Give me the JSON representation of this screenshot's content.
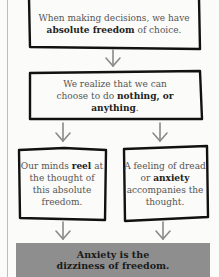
{
  "diagram": {
    "type": "flowchart",
    "colors": {
      "background": "#fbfbf9",
      "box_border": "#111111",
      "arrow": "#8a8a8a",
      "banner_fill": "#8e8e8e",
      "text": "#555555",
      "emphasis": "#222222"
    },
    "nodes": [
      {
        "id": "absolute-freedom",
        "parts": [
          {
            "text": "When making decisions, we have ",
            "bold": false
          },
          {
            "text": "absolute freedom",
            "bold": true
          },
          {
            "text": " of choice.",
            "bold": false
          }
        ]
      },
      {
        "id": "nothing-or-anything",
        "parts": [
          {
            "text": "We realize that we can choose to do ",
            "bold": false
          },
          {
            "text": "nothing, or anything",
            "bold": true
          },
          {
            "text": ".",
            "bold": false
          }
        ]
      },
      {
        "id": "minds-reel",
        "parts": [
          {
            "text": "Our minds ",
            "bold": false
          },
          {
            "text": "reel",
            "bold": true
          },
          {
            "text": " at the thought of this absolute freedom.",
            "bold": false
          }
        ]
      },
      {
        "id": "dread-anxiety",
        "parts": [
          {
            "text": "A feeling of dread or ",
            "bold": false
          },
          {
            "text": "anxiety",
            "bold": true
          },
          {
            "text": " accompanies the thought.",
            "bold": false
          }
        ]
      }
    ],
    "edges": [
      {
        "from": "absolute-freedom",
        "to": "nothing-or-anything"
      },
      {
        "from": "nothing-or-anything",
        "to": "minds-reel"
      },
      {
        "from": "nothing-or-anything",
        "to": "dread-anxiety"
      },
      {
        "from": "minds-reel",
        "to": "conclusion"
      },
      {
        "from": "dread-anxiety",
        "to": "conclusion"
      }
    ],
    "conclusion": {
      "id": "conclusion",
      "line1": "Anxiety is the",
      "line2": "dizziness of freedom."
    }
  }
}
